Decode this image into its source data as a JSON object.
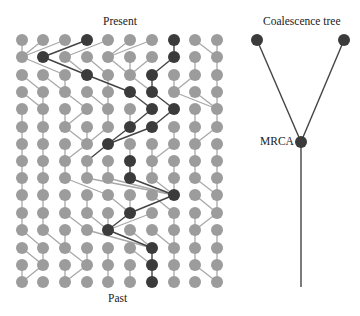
{
  "labels": {
    "present": "Present",
    "past": "Past",
    "tree_title": "Coalescence tree",
    "mrca": "MRCA"
  },
  "colors": {
    "light_node": "#9c9c9c",
    "dark_node": "#3b3b3b",
    "light_edge": "#a8a8a8",
    "dark_edge": "#444444"
  },
  "grid": {
    "columns": 10,
    "rows": 15,
    "col_x": [
      22,
      43,
      65,
      87,
      108,
      130,
      152,
      174,
      195,
      217
    ],
    "row_y": [
      40,
      57,
      75,
      92,
      109,
      127,
      144,
      161,
      178,
      195,
      213,
      230,
      248,
      265,
      282
    ],
    "node_radius": 6,
    "parents": [
      [
        0,
        0,
        0,
        1,
        2,
        4,
        4,
        7,
        9,
        9
      ],
      [
        2,
        3,
        3,
        4,
        5,
        5,
        5,
        6,
        8,
        9
      ],
      [
        1,
        2,
        2,
        5,
        4,
        6,
        6,
        7,
        7,
        9
      ],
      [
        1,
        1,
        3,
        4,
        4,
        6,
        7,
        9,
        9,
        9
      ],
      [
        0,
        1,
        2,
        2,
        4,
        5,
        5,
        6,
        8,
        9
      ],
      [
        0,
        1,
        3,
        3,
        3,
        4,
        4,
        7,
        8,
        8
      ],
      [
        0,
        1,
        2,
        2,
        3,
        5,
        6,
        6,
        8,
        9
      ],
      [
        0,
        1,
        2,
        3,
        4,
        5,
        6,
        7,
        8,
        9
      ],
      [
        0,
        1,
        4,
        7,
        7,
        7,
        7,
        7,
        9,
        9
      ],
      [
        0,
        1,
        2,
        3,
        5,
        5,
        7,
        5,
        9,
        9
      ],
      [
        0,
        1,
        3,
        4,
        4,
        4,
        4,
        7,
        8,
        8
      ],
      [
        1,
        2,
        2,
        6,
        6,
        6,
        7,
        7,
        8,
        9
      ],
      [
        1,
        1,
        3,
        3,
        4,
        6,
        6,
        7,
        8,
        9
      ],
      [
        0,
        0,
        2,
        2,
        4,
        5,
        6,
        7,
        9,
        9
      ]
    ],
    "dark_nodes": [
      [
        0,
        3
      ],
      [
        0,
        7
      ],
      [
        1,
        1
      ],
      [
        1,
        7
      ],
      [
        2,
        3
      ],
      [
        2,
        6
      ],
      [
        3,
        5
      ],
      [
        3,
        6
      ],
      [
        4,
        6
      ],
      [
        4,
        7
      ],
      [
        5,
        5
      ],
      [
        5,
        6
      ],
      [
        6,
        4
      ],
      [
        7,
        5
      ],
      [
        8,
        5
      ],
      [
        9,
        7
      ],
      [
        10,
        5
      ],
      [
        11,
        4
      ],
      [
        12,
        6
      ],
      [
        13,
        6
      ],
      [
        14,
        6
      ]
    ],
    "dark_edges": [
      [
        0,
        3
      ],
      [
        0,
        7
      ],
      [
        1,
        1
      ],
      [
        1,
        7
      ],
      [
        2,
        3
      ],
      [
        2,
        6
      ],
      [
        3,
        5
      ],
      [
        3,
        6
      ],
      [
        4,
        6
      ],
      [
        4,
        7
      ],
      [
        5,
        5
      ],
      [
        5,
        6
      ],
      [
        6,
        4
      ],
      [
        7,
        5
      ],
      [
        8,
        5
      ],
      [
        9,
        7
      ],
      [
        10,
        5
      ],
      [
        11,
        4
      ],
      [
        12,
        6
      ],
      [
        13,
        6
      ]
    ]
  },
  "tree": {
    "left_leaf": [
      257,
      40
    ],
    "right_leaf": [
      344,
      40
    ],
    "mrca": [
      301,
      142
    ],
    "root_end": [
      301,
      287
    ],
    "node_radius": 6
  }
}
